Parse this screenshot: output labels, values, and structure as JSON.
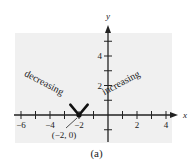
{
  "figure": {
    "caption": "(a)",
    "background_color": "#f0f0f0",
    "axis_color": "#222222"
  },
  "chart_data": {
    "type": "line",
    "title": "",
    "xlabel": "x",
    "ylabel": "y",
    "xlim": [
      -6.5,
      4.5
    ],
    "ylim": [
      -2,
      6
    ],
    "x_ticks": [
      -6,
      -5,
      -4,
      -3,
      -2,
      -1,
      1,
      2,
      3,
      4
    ],
    "x_tick_labels": [
      "-6",
      "-4",
      "-2",
      "2",
      "4"
    ],
    "x_labeled_values": [
      -6,
      -4,
      -2,
      2,
      4
    ],
    "y_ticks": [
      -1,
      1,
      2,
      3,
      4,
      5
    ],
    "y_tick_labels": [
      "2",
      "4"
    ],
    "y_labeled_values": [
      2,
      4
    ],
    "grid": false,
    "series": [
      {
        "name": "V-shaped vertex",
        "points": [
          [
            -2.6,
            0.7
          ],
          [
            -2,
            0
          ],
          [
            -1.4,
            0.7
          ]
        ]
      }
    ],
    "points": [
      {
        "x": -2,
        "y": 0,
        "label": "(−2, 0)"
      }
    ],
    "annotations": [
      {
        "text": "decreasing",
        "x": -4.5,
        "y": 2.0,
        "rotation": 28
      },
      {
        "text": "increasing",
        "x": 1.0,
        "y": 2.0,
        "rotation": -28
      },
      {
        "text": "(−2, 0)",
        "x": -3.0,
        "y": -1.4
      }
    ],
    "legend": null
  }
}
